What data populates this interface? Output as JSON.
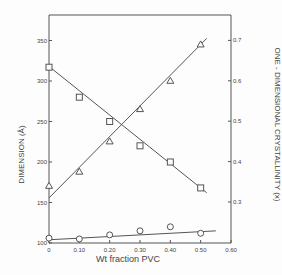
{
  "chart_data": {
    "type": "scatter",
    "title": "",
    "xlabel": "Wt fraction PVC",
    "ylabel": "DIMENSION (Å)",
    "ylabel_right": "ONE - DIMENSIONAL  CRYSTALLINITY (x)",
    "xlim": [
      0,
      0.6
    ],
    "ylim": [
      100,
      380
    ],
    "ylim_right": [
      0.25,
      0.75
    ],
    "x_ticks": [
      "0",
      "0.10",
      "0.20",
      "0.30",
      "0.40",
      "0.50",
      "0.60"
    ],
    "y_ticks": [
      "100",
      "150",
      "200",
      "250",
      "300",
      "350"
    ],
    "y_ticks_right": [
      "0.3",
      "0.4",
      "0.5",
      "0.6",
      "0.7"
    ],
    "grid": false,
    "series": [
      {
        "name": "Dimension (squares)",
        "marker": "square",
        "axis": "left",
        "x": [
          0,
          0.1,
          0.2,
          0.3,
          0.4,
          0.5
        ],
        "values": [
          317,
          280,
          250,
          220,
          200,
          168
        ]
      },
      {
        "name": "Crystallinity (triangles)",
        "marker": "triangle",
        "axis": "right",
        "x": [
          0,
          0.1,
          0.2,
          0.3,
          0.4,
          0.5
        ],
        "values": [
          0.34,
          0.375,
          0.45,
          0.53,
          0.6,
          0.69
        ]
      },
      {
        "name": "Dimension (circles)",
        "marker": "circle",
        "axis": "left",
        "x": [
          0,
          0.1,
          0.2,
          0.3,
          0.4,
          0.5
        ],
        "values": [
          106,
          105,
          110,
          115,
          120,
          112
        ]
      }
    ]
  },
  "labels": {
    "xlabel": "Wt fraction PVC",
    "ylabel": "DIMENSION (Å)",
    "ylabel_right": "ONE - DIMENSIONAL  CRYSTALLINITY (x)"
  }
}
